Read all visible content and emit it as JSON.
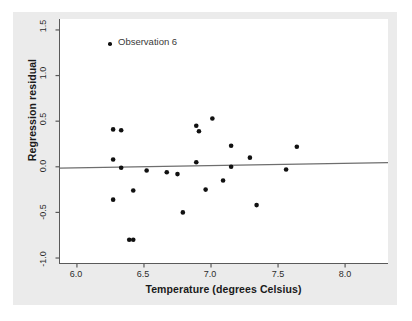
{
  "figure": {
    "background_color": "#ffffff",
    "card_color": "#ebebeb",
    "plot_background": "#ffffff",
    "axis_color": "#5a5a5a",
    "point_color": "#111111",
    "line_color": "#6e6e6e"
  },
  "legend": {
    "entries": [
      {
        "label": "Observation 6",
        "marker": "filled-circle",
        "color": "#111111"
      }
    ],
    "position": "top-left-inside"
  },
  "chart_data": {
    "type": "scatter",
    "title": "",
    "xlabel": "Temperature (degrees Celsius)",
    "ylabel": "Regression residual",
    "xlim": [
      5.87,
      8.32
    ],
    "ylim": [
      -1.06,
      1.62
    ],
    "xticks": [
      6.0,
      6.5,
      7.0,
      7.5,
      8.0
    ],
    "xticklabels": [
      "6.0",
      "6.5",
      "7.0",
      "7.5",
      "8.0"
    ],
    "yticks": [
      1.5,
      1.0,
      0.5,
      0.0,
      -0.5,
      -1.0
    ],
    "yticklabels": [
      "1.5",
      "1.0",
      "0.5",
      "0.0",
      "-0.5",
      "-1.0"
    ],
    "grid": false,
    "legend_position": "upper left",
    "series": [
      {
        "name": "Observation 6",
        "marker": "filled-circle",
        "color": "#111111",
        "points": [
          {
            "x": 6.27,
            "y": 0.41
          },
          {
            "x": 6.27,
            "y": 0.08
          },
          {
            "x": 6.27,
            "y": -0.36
          },
          {
            "x": 6.33,
            "y": 0.4
          },
          {
            "x": 6.33,
            "y": -0.01
          },
          {
            "x": 6.39,
            "y": -0.8
          },
          {
            "x": 6.42,
            "y": -0.8
          },
          {
            "x": 6.42,
            "y": -0.26
          },
          {
            "x": 6.52,
            "y": -0.04
          },
          {
            "x": 6.67,
            "y": -0.06
          },
          {
            "x": 6.75,
            "y": -0.08
          },
          {
            "x": 6.79,
            "y": -0.5
          },
          {
            "x": 6.89,
            "y": 0.45
          },
          {
            "x": 6.89,
            "y": 0.05
          },
          {
            "x": 6.91,
            "y": 0.39
          },
          {
            "x": 6.96,
            "y": -0.25
          },
          {
            "x": 7.01,
            "y": 0.53
          },
          {
            "x": 7.09,
            "y": -0.15
          },
          {
            "x": 7.15,
            "y": 0.23
          },
          {
            "x": 7.15,
            "y": 0.0
          },
          {
            "x": 7.29,
            "y": 0.1
          },
          {
            "x": 7.34,
            "y": -0.42
          },
          {
            "x": 7.56,
            "y": -0.03
          },
          {
            "x": 7.64,
            "y": 0.22
          }
        ]
      }
    ],
    "reference_line": {
      "type": "regression-fit",
      "description": "near-horizontal fitted line at residual zero",
      "x_start": 5.87,
      "y_start": -0.015,
      "x_end": 8.32,
      "y_end": 0.045,
      "color": "#6e6e6e"
    }
  }
}
